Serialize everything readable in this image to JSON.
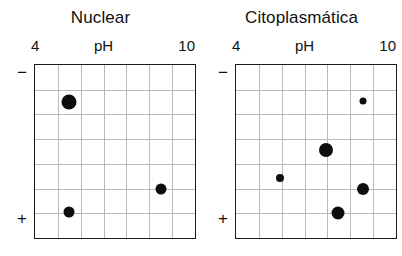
{
  "figure": {
    "type": "two-dimensional-gel-electrophoresis",
    "panels": [
      {
        "id": "nuclear",
        "title": "Nuclear",
        "axis": {
          "x_label": "pH",
          "x_min_label": "4",
          "x_max_label": "10",
          "y_top_label": "−",
          "y_bottom_label": "+"
        },
        "grid": {
          "columns": 7,
          "rows": 7
        },
        "spots": [
          {
            "label": "spot-1",
            "x_pct": 21.0,
            "y_pct": 21.5,
            "diameter": 15
          },
          {
            "label": "spot-2",
            "x_pct": 79.0,
            "y_pct": 71.5,
            "diameter": 11
          },
          {
            "label": "spot-3",
            "x_pct": 21.0,
            "y_pct": 85.0,
            "diameter": 11
          }
        ]
      },
      {
        "id": "citoplasmatica",
        "title": "Citoplasmática",
        "axis": {
          "x_label": "pH",
          "x_min_label": "4",
          "x_max_label": "10",
          "y_top_label": "−",
          "y_bottom_label": "+"
        },
        "grid": {
          "columns": 7,
          "rows": 7
        },
        "spots": [
          {
            "label": "spot-1",
            "x_pct": 79.5,
            "y_pct": 21.0,
            "diameter": 7
          },
          {
            "label": "spot-2",
            "x_pct": 56.5,
            "y_pct": 49.0,
            "diameter": 14
          },
          {
            "label": "spot-3",
            "x_pct": 27.5,
            "y_pct": 65.5,
            "diameter": 8
          },
          {
            "label": "spot-4",
            "x_pct": 79.5,
            "y_pct": 71.5,
            "diameter": 12
          },
          {
            "label": "spot-5",
            "x_pct": 63.5,
            "y_pct": 85.5,
            "diameter": 13
          }
        ]
      }
    ],
    "colors": {
      "spot": "#0d0d0d",
      "border": "#1a1a1a",
      "gridline": "#b9b9bd",
      "background": "#ffffff",
      "text": "#111111"
    }
  }
}
